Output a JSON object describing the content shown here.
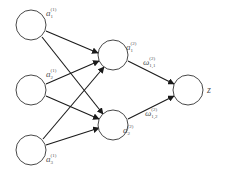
{
  "diagram": {
    "type": "neural-network",
    "colors": {
      "node_stroke": "#333333",
      "edge": "#1a1a1a",
      "label": "#555555",
      "background": "#ffffff"
    },
    "layers": [
      {
        "name": "input",
        "nodes": [
          {
            "id": "a1_1",
            "symbol": "a",
            "sub": "1",
            "sup": "(1)"
          },
          {
            "id": "a2_1",
            "symbol": "a",
            "sub": "2",
            "sup": "(1)"
          },
          {
            "id": "a3_1",
            "symbol": "a",
            "sub": "3",
            "sup": "(1)"
          }
        ]
      },
      {
        "name": "hidden",
        "nodes": [
          {
            "id": "a1_2",
            "symbol": "a",
            "sub": "1",
            "sup": "(2)"
          },
          {
            "id": "a2_2",
            "symbol": "a",
            "sub": "2",
            "sup": "(2)"
          }
        ]
      },
      {
        "name": "output",
        "nodes": [
          {
            "id": "z",
            "symbol": "z"
          }
        ]
      }
    ],
    "edges": [
      {
        "from": "a1_1",
        "to": "a1_2"
      },
      {
        "from": "a1_1",
        "to": "a2_2"
      },
      {
        "from": "a2_1",
        "to": "a1_2"
      },
      {
        "from": "a2_1",
        "to": "a2_2"
      },
      {
        "from": "a3_1",
        "to": "a1_2"
      },
      {
        "from": "a3_1",
        "to": "a2_2"
      },
      {
        "from": "a1_2",
        "to": "z",
        "weight": {
          "symbol": "ω",
          "sub": "1,1",
          "sup": "(2)"
        }
      },
      {
        "from": "a2_2",
        "to": "z",
        "weight": {
          "symbol": "ω",
          "sub": "1,2",
          "sup": "(2)"
        }
      }
    ]
  }
}
